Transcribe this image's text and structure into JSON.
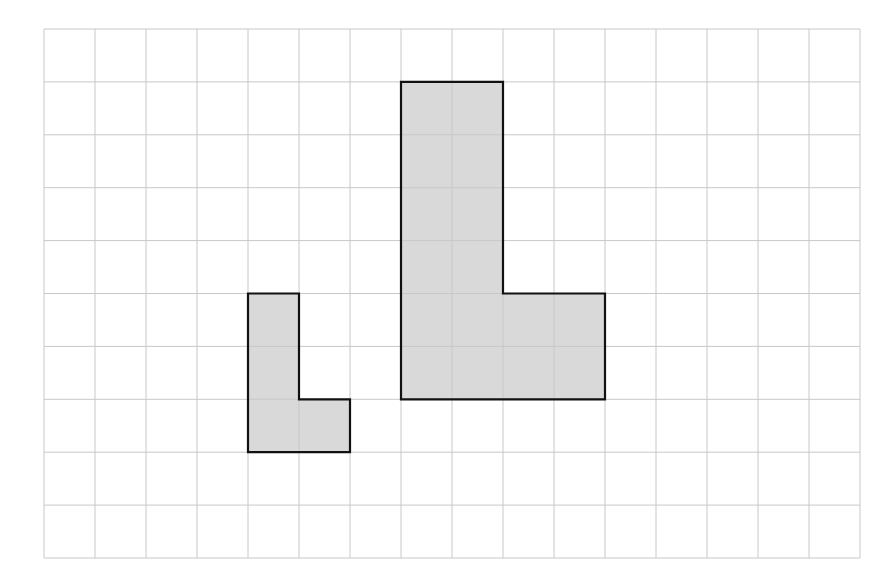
{
  "diagram": {
    "type": "grid-with-shapes",
    "grid": {
      "columns": 16,
      "rows": 10,
      "origin_px": [
        44,
        29
      ],
      "cell_width_px": 51,
      "cell_height_px": 52.9,
      "line_color": "#c8c8c8",
      "background": "#ffffff"
    },
    "shapes": [
      {
        "name": "small-l-shape",
        "fill": "#d9d9d9",
        "stroke": "#111111",
        "vertices": [
          [
            4,
            5
          ],
          [
            5,
            5
          ],
          [
            5,
            7
          ],
          [
            6,
            7
          ],
          [
            6,
            8
          ],
          [
            4,
            8
          ]
        ],
        "cell_area": 4
      },
      {
        "name": "large-l-shape",
        "fill": "#d9d9d9",
        "stroke": "#111111",
        "vertices": [
          [
            7,
            1
          ],
          [
            9,
            1
          ],
          [
            9,
            5
          ],
          [
            11,
            5
          ],
          [
            11,
            7
          ],
          [
            7,
            7
          ]
        ],
        "cell_area": 16
      }
    ]
  }
}
